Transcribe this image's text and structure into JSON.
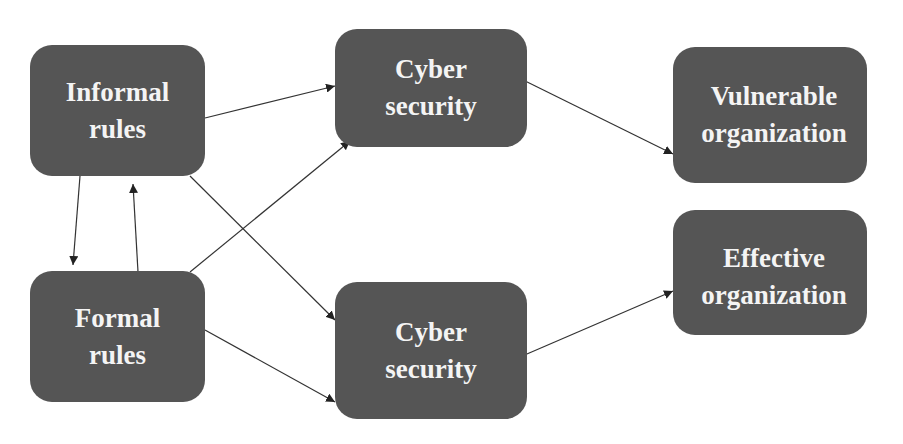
{
  "diagram": {
    "type": "flow-diagram",
    "colors": {
      "node_fill": "#555555",
      "node_text": "#f4f4f4",
      "edge": "#333333",
      "background": "#ffffff"
    },
    "nodes": [
      {
        "id": "informal_rules",
        "line1": "Informal",
        "line2": "rules"
      },
      {
        "id": "formal_rules",
        "line1": "Formal",
        "line2": "rules"
      },
      {
        "id": "cyber_security_top",
        "line1": "Cyber",
        "line2": "security"
      },
      {
        "id": "cyber_security_bottom",
        "line1": "Cyber",
        "line2": "security"
      },
      {
        "id": "vulnerable_organization",
        "line1": "Vulnerable",
        "line2": "organization"
      },
      {
        "id": "effective_organization",
        "line1": "Effective",
        "line2": "organization"
      }
    ],
    "edges": [
      {
        "from": "informal_rules",
        "to": "cyber_security_top"
      },
      {
        "from": "informal_rules",
        "to": "cyber_security_bottom"
      },
      {
        "from": "formal_rules",
        "to": "cyber_security_top"
      },
      {
        "from": "formal_rules",
        "to": "cyber_security_bottom"
      },
      {
        "from": "informal_rules",
        "to": "formal_rules"
      },
      {
        "from": "formal_rules",
        "to": "informal_rules"
      },
      {
        "from": "cyber_security_top",
        "to": "vulnerable_organization"
      },
      {
        "from": "cyber_security_bottom",
        "to": "effective_organization"
      }
    ]
  }
}
